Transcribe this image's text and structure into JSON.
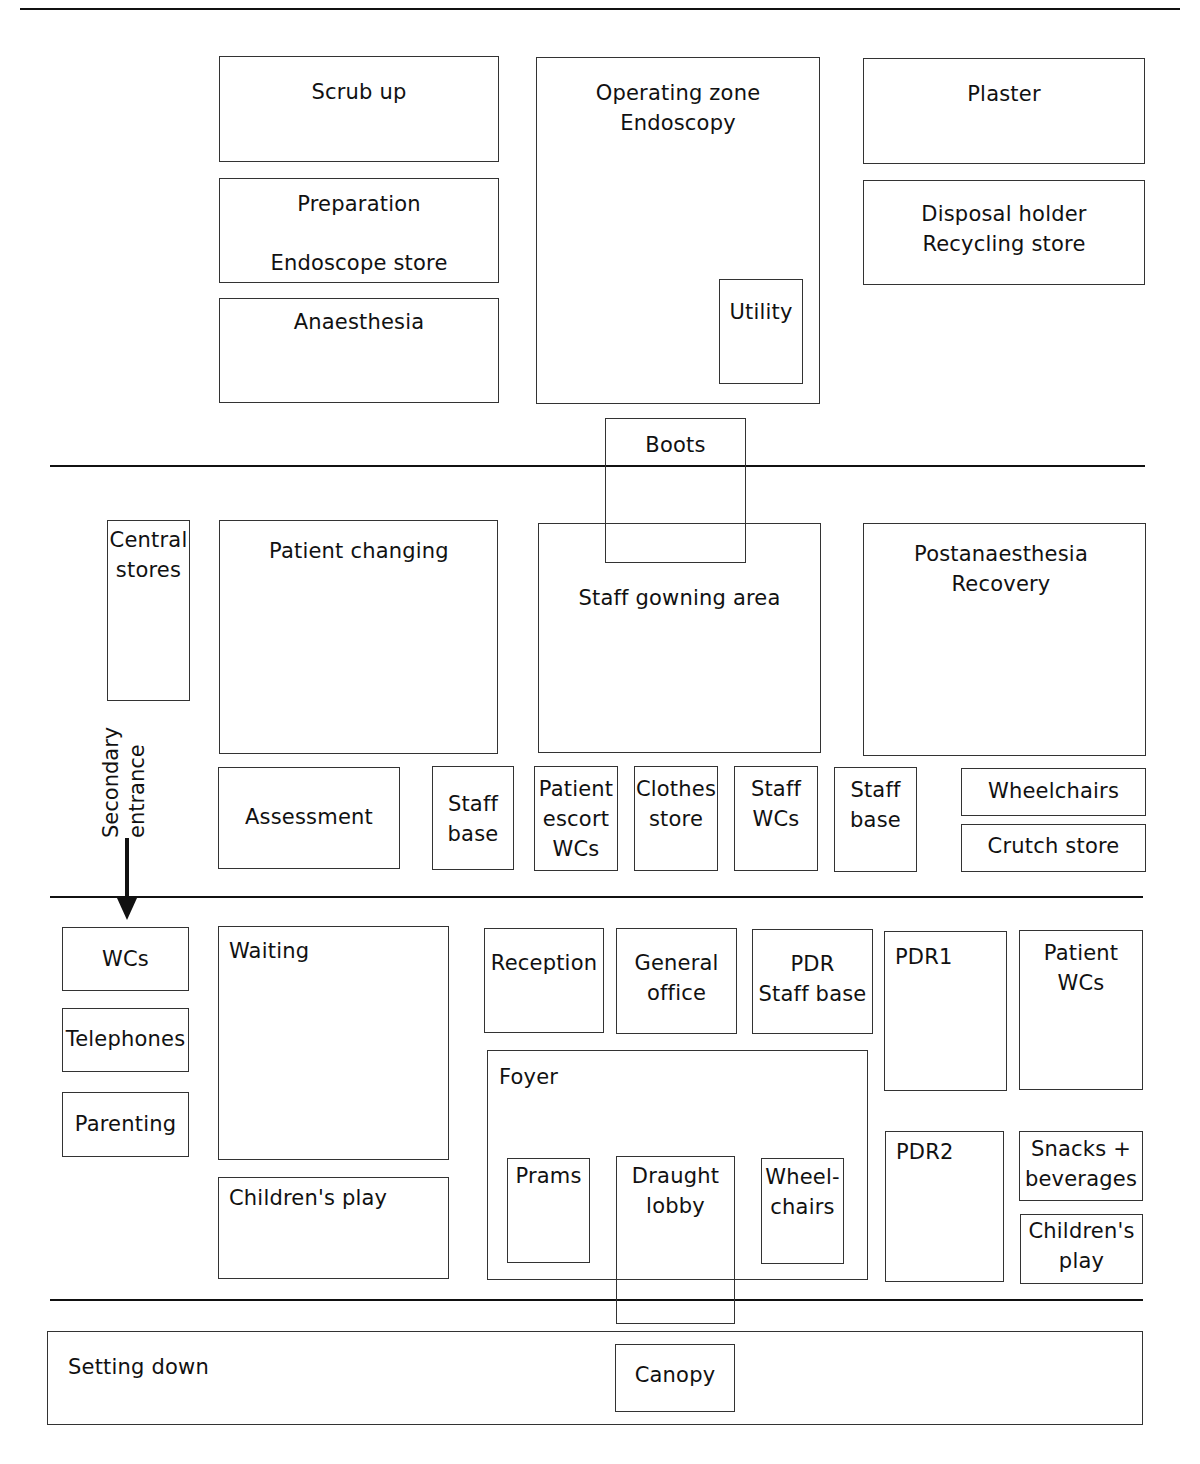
{
  "diagram": {
    "type": "floor-plan",
    "zones": [
      {
        "name": "operating",
        "rooms": [
          {
            "id": "scrub-up",
            "label": "Scrub up"
          },
          {
            "id": "preparation",
            "label": "Preparation",
            "label2": "Endoscope store"
          },
          {
            "id": "anaesthesia",
            "label": "Anaesthesia"
          },
          {
            "id": "operating-zone",
            "label": "Operating zone\nEndoscopy"
          },
          {
            "id": "utility",
            "label": "Utility"
          },
          {
            "id": "plaster",
            "label": "Plaster"
          },
          {
            "id": "disposal",
            "label": "Disposal holder\nRecycling store"
          },
          {
            "id": "boots",
            "label": "Boots"
          }
        ]
      },
      {
        "name": "preparation-recovery",
        "rooms": [
          {
            "id": "central-stores",
            "label": "Central\nstores"
          },
          {
            "id": "patient-changing",
            "label": "Patient changing"
          },
          {
            "id": "staff-gowning",
            "label": "Staff gowning area"
          },
          {
            "id": "postanaesthesia",
            "label": "Postanaesthesia\nRecovery"
          },
          {
            "id": "assessment",
            "label": "Assessment"
          },
          {
            "id": "staff-base-1",
            "label": "Staff\nbase"
          },
          {
            "id": "patient-escort-wcs",
            "label": "Patient\nescort\nWCs"
          },
          {
            "id": "clothes-store",
            "label": "Clothes\nstore"
          },
          {
            "id": "staff-wcs",
            "label": "Staff\nWCs"
          },
          {
            "id": "staff-base-2",
            "label": "Staff\nbase"
          },
          {
            "id": "wheelchairs-1",
            "label": "Wheelchairs"
          },
          {
            "id": "crutch-store",
            "label": "Crutch store"
          }
        ]
      },
      {
        "name": "reception",
        "rooms": [
          {
            "id": "wcs",
            "label": "WCs"
          },
          {
            "id": "telephones",
            "label": "Telephones"
          },
          {
            "id": "parenting",
            "label": "Parenting"
          },
          {
            "id": "waiting",
            "label": "Waiting"
          },
          {
            "id": "childrens-play-1",
            "label": "Children's play"
          },
          {
            "id": "reception",
            "label": "Reception"
          },
          {
            "id": "general-office",
            "label": "General\noffice"
          },
          {
            "id": "pdr-staff-base",
            "label": "PDR\nStaff base"
          },
          {
            "id": "pdr1",
            "label": "PDR1"
          },
          {
            "id": "patient-wcs",
            "label": "Patient\nWCs"
          },
          {
            "id": "foyer",
            "label": "Foyer"
          },
          {
            "id": "prams",
            "label": "Prams"
          },
          {
            "id": "draught-lobby",
            "label": "Draught\nlobby"
          },
          {
            "id": "wheelchairs-2",
            "label": "Wheel-\nchairs"
          },
          {
            "id": "pdr2",
            "label": "PDR2"
          },
          {
            "id": "snacks",
            "label": "Snacks +\nbeverages"
          },
          {
            "id": "childrens-play-2",
            "label": "Children's\nplay"
          }
        ]
      },
      {
        "name": "external",
        "rooms": [
          {
            "id": "setting-down",
            "label": "Setting down"
          },
          {
            "id": "canopy",
            "label": "Canopy"
          }
        ]
      }
    ],
    "annotations": {
      "secondary_entrance": "Secondary\nentrance"
    }
  }
}
